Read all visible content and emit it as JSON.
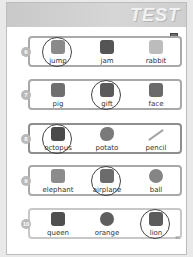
{
  "banner": {
    "word": "TEST"
  },
  "page_number": "85",
  "rows": [
    {
      "number": "6",
      "style": "normal",
      "items": [
        {
          "word": "jump",
          "icon": "jump-icon",
          "circled": true,
          "shade": "#8a8a8a"
        },
        {
          "word": "jam",
          "icon": "jam-jar-icon",
          "circled": false,
          "shade": "#555555"
        },
        {
          "word": "rabbit",
          "icon": "rabbit-icon",
          "circled": false,
          "shade": "#bcbcbc"
        }
      ]
    },
    {
      "number": "7",
      "style": "normal",
      "items": [
        {
          "word": "pig",
          "icon": "pig-icon",
          "circled": false,
          "shade": "#6f6f6f"
        },
        {
          "word": "gift",
          "icon": "gift-icon",
          "circled": true,
          "shade": "#5a5a5a"
        },
        {
          "word": "face",
          "icon": "face-icon",
          "circled": false,
          "shade": "#6a6a6a"
        }
      ]
    },
    {
      "number": "8",
      "style": "thick",
      "items": [
        {
          "word": "octopus",
          "icon": "octopus-icon",
          "circled": true,
          "shade": "#4a4a4a"
        },
        {
          "word": "potato",
          "icon": "potato-icon",
          "circled": false,
          "shade": "#7a7a7a"
        },
        {
          "word": "pencil",
          "icon": "pencil-icon",
          "circled": false,
          "shade": "#a5a5a5"
        }
      ]
    },
    {
      "number": "9",
      "style": "normal",
      "items": [
        {
          "word": "elephant",
          "icon": "elephant-icon",
          "circled": false,
          "shade": "#8c8c8c"
        },
        {
          "word": "airplane",
          "icon": "airplane-icon",
          "circled": true,
          "shade": "#6c6c6c"
        },
        {
          "word": "ball",
          "icon": "ball-icon",
          "circled": false,
          "shade": "#858585"
        }
      ]
    },
    {
      "number": "10",
      "style": "light",
      "items": [
        {
          "word": "queen",
          "icon": "queen-icon",
          "circled": false,
          "shade": "#4f4f4f"
        },
        {
          "word": "orange",
          "icon": "orange-icon",
          "circled": false,
          "shade": "#5e5e5e"
        },
        {
          "word": "lion",
          "icon": "lion-icon",
          "circled": true,
          "shade": "#5c5c5c"
        }
      ]
    }
  ]
}
